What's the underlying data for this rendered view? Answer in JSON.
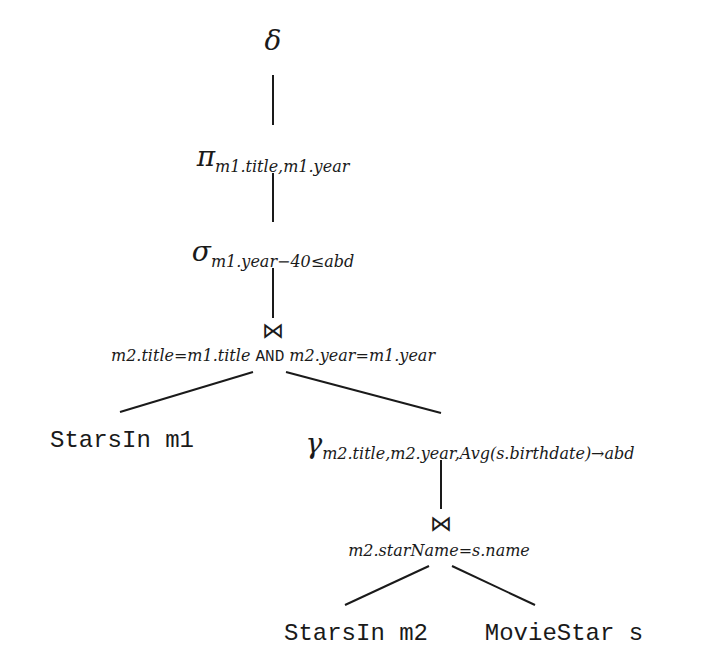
{
  "diagram": {
    "type": "relational-algebra-expression-tree",
    "nodes": {
      "duplicate_elimination": {
        "symbol": "δ",
        "subscript": ""
      },
      "projection": {
        "symbol": "π",
        "subscript": "m1.title,m1.year"
      },
      "selection": {
        "symbol": "σ",
        "subscript": "m1.year−40≤abd"
      },
      "join_top": {
        "symbol": "⋈",
        "condition_left": "m2.title=m1.title",
        "condition_and": "AND",
        "condition_right": "m2.year=m1.year"
      },
      "relation_m1": {
        "label": "StarsIn m1"
      },
      "grouping": {
        "symbol": "γ",
        "subscript": "m2.title,m2.year,Avg(s.birthdate)→abd"
      },
      "join_bottom": {
        "symbol": "⋈",
        "condition": "m2.starName=s.name"
      },
      "relation_m2": {
        "label": "StarsIn m2"
      },
      "relation_s": {
        "label": "MovieStar s"
      }
    },
    "edges": [
      [
        "duplicate_elimination",
        "projection"
      ],
      [
        "projection",
        "selection"
      ],
      [
        "selection",
        "join_top"
      ],
      [
        "join_top",
        "relation_m1"
      ],
      [
        "join_top",
        "grouping"
      ],
      [
        "grouping",
        "join_bottom"
      ],
      [
        "join_bottom",
        "relation_m2"
      ],
      [
        "join_bottom",
        "relation_s"
      ]
    ],
    "colors": {
      "ink": "#1a1a1a",
      "background": "#ffffff"
    }
  }
}
